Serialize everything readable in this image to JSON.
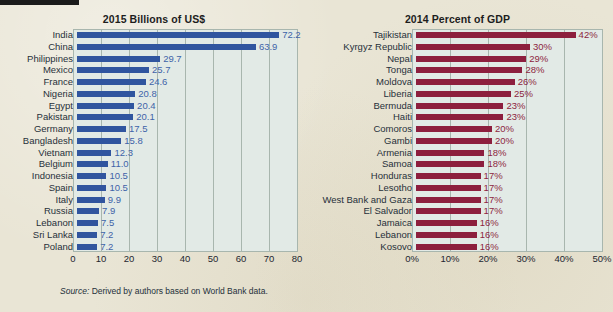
{
  "figure": {
    "source_prefix": "Source:",
    "source_text": " Derived by authors based on World Bank data.",
    "background_color": "#e9e5d5",
    "plot_area_color": "#e2eae6",
    "grid_color": "#a8b6ae"
  },
  "chart_data": [
    {
      "id": "left",
      "type": "bar",
      "orientation": "horizontal",
      "title": "2015 Billions of US$",
      "xlabel": "",
      "ylabel": "",
      "xlim": [
        0,
        80
      ],
      "xticks": [
        0,
        10,
        20,
        30,
        40,
        50,
        60,
        70,
        80
      ],
      "xticklabels": [
        "0",
        "10",
        "20",
        "30",
        "40",
        "50",
        "60",
        "70",
        "80"
      ],
      "grid": true,
      "legend": "none",
      "series_color": "#30559f",
      "label_color": "#3e63a8",
      "categories": [
        "India",
        "China",
        "Philippines",
        "Mexico",
        "France",
        "Nigeria",
        "Egypt",
        "Pakistan",
        "Germany",
        "Bangladesh",
        "Vietnam",
        "Belgium",
        "Indonesia",
        "Spain",
        "Italy",
        "Russia",
        "Lebanon",
        "Sri Lanka",
        "Poland"
      ],
      "values": [
        72.2,
        63.9,
        29.7,
        25.7,
        24.6,
        20.8,
        20.4,
        20.1,
        17.5,
        15.8,
        12.3,
        11.0,
        10.5,
        10.5,
        9.9,
        7.9,
        7.5,
        7.2,
        7.2
      ],
      "value_labels": [
        "72.2",
        "63.9",
        "29.7",
        "25.7",
        "24.6",
        "20.8",
        "20.4",
        "20.1",
        "17.5",
        "15.8",
        "12.3",
        "11.0",
        "10.5",
        "10.5",
        "9.9",
        "7.9",
        "7.5",
        "7.2",
        "7.2"
      ]
    },
    {
      "id": "right",
      "type": "bar",
      "orientation": "horizontal",
      "title": "2014 Percent of GDP",
      "xlabel": "",
      "ylabel": "",
      "xlim": [
        0,
        50
      ],
      "xticks": [
        0,
        10,
        20,
        30,
        40,
        50
      ],
      "xticklabels": [
        "0%",
        "10%",
        "20%",
        "30%",
        "40%",
        "50%"
      ],
      "grid": true,
      "legend": "none",
      "series_color": "#8d1f3e",
      "label_color": "#8d1f3e",
      "categories": [
        "Tajikistan",
        "Kyrgyz Republic",
        "Nepal",
        "Tonga",
        "Moldova",
        "Liberia",
        "Bermuda",
        "Haiti",
        "Comoros",
        "Gambi",
        "Armenia",
        "Samoa",
        "Honduras",
        "Lesotho",
        "West Bank and Gaza",
        "El Salvador",
        "Jamaica",
        "Lebanon",
        "Kosovo"
      ],
      "values": [
        42,
        30,
        29,
        28,
        26,
        25,
        23,
        23,
        20,
        20,
        18,
        18,
        17,
        17,
        17,
        17,
        16,
        16,
        16
      ],
      "value_labels": [
        "42%",
        "30%",
        "29%",
        "28%",
        "26%",
        "25%",
        "23%",
        "23%",
        "20%",
        "20%",
        "18%",
        "18%",
        "17%",
        "17%",
        "17%",
        "17%",
        "16%",
        "16%",
        "16%"
      ]
    }
  ]
}
